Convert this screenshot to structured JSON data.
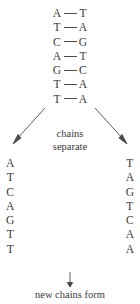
{
  "diagram": {
    "ink_color": "#3a3a3a",
    "background_color": "#ffffff",
    "duplex": {
      "bond_symbol": "—",
      "pairs": [
        {
          "left": "A",
          "right": "T"
        },
        {
          "left": "T",
          "right": "A"
        },
        {
          "left": "C",
          "right": "G"
        },
        {
          "left": "A",
          "right": "T"
        },
        {
          "left": "G",
          "right": "C"
        },
        {
          "left": "T",
          "right": "A"
        },
        {
          "left": "T",
          "right": "A"
        }
      ]
    },
    "separation_step": {
      "label_line1": "chains",
      "label_line2": "separate",
      "left_arrow_name": "down-left-arrow",
      "right_arrow_name": "down-right-arrow"
    },
    "strands": {
      "left": [
        "A",
        "T",
        "C",
        "A",
        "G",
        "T",
        "T"
      ],
      "right": [
        "T",
        "A",
        "G",
        "T",
        "C",
        "A",
        "A"
      ]
    },
    "formation_step": {
      "label": "new chains form",
      "arrow_name": "down-arrow"
    }
  }
}
